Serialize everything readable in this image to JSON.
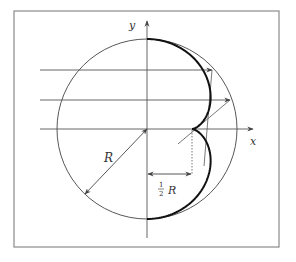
{
  "figure": {
    "frame": {
      "x": 14,
      "y": 11,
      "width": 265,
      "height": 236,
      "color": "#8a8a8a"
    },
    "circle": {
      "cx": 147,
      "cy": 129,
      "r": 90,
      "color": "#444444"
    },
    "axes": {
      "x_label": "x",
      "y_label": "y",
      "color": "#555555"
    },
    "labels": {
      "radius": "R",
      "half_numerator": "1",
      "half_denominator": "2",
      "half_symbol": "R"
    },
    "rays": [
      {
        "y": 70
      },
      {
        "y": 100
      },
      {
        "y": 129
      }
    ],
    "caustic": {
      "color": "#111111",
      "cusp_fraction": 0.5
    }
  }
}
